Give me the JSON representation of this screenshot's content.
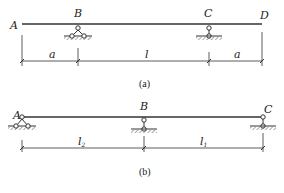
{
  "figure_a": {
    "caption": "(a)",
    "points": {
      "A": "A",
      "B": "B",
      "C": "C",
      "D": "D"
    },
    "supports": {
      "B": "pinned (fixed hinge)",
      "C": "roller"
    },
    "dimensions": [
      "a",
      "l",
      "a"
    ]
  },
  "figure_b": {
    "caption": "(b)",
    "points": {
      "A": "A",
      "B": "B",
      "C": "C"
    },
    "supports": {
      "A": "pinned (fixed hinge)",
      "B": "roller",
      "C": "roller"
    },
    "dimensions": [
      {
        "base": "l",
        "sub": "2"
      },
      {
        "base": "l",
        "sub": "1"
      }
    ]
  },
  "colors": {
    "line": "#333333",
    "hatch": "#555555",
    "background": "#ffffff"
  }
}
